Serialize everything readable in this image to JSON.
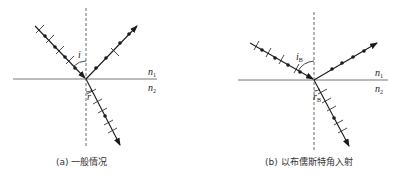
{
  "figure_a": {
    "caption": "(a) 一般情况",
    "incident_angle_label": "i",
    "refraction_angle_label": "r",
    "medium1_label": "n",
    "medium1_sub": "1",
    "medium2_label": "n",
    "medium2_sub": "2"
  },
  "figure_b": {
    "caption": "(b) 以布儒斯特角入射",
    "incident_angle_label": "i",
    "incident_angle_sub": "B",
    "refraction_angle_label": "r",
    "refraction_angle_sub": "B",
    "medium1_label": "n",
    "medium1_sub": "1",
    "medium2_label": "n",
    "medium2_sub": "2"
  },
  "colors": {
    "line": "#1a1a1a",
    "interface": "#777777",
    "normal": "#444444"
  }
}
